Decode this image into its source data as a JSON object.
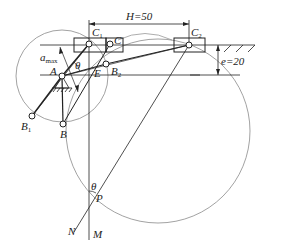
{
  "diagram": {
    "type": "offset slider-crank mechanism (graphical design)",
    "dimensions": {
      "stroke": "H=50",
      "offset": "e=20"
    },
    "labels": {
      "A": "A",
      "B": "B",
      "B1": "B",
      "B1_sub": "1",
      "B2": "B",
      "B2_sub": "2",
      "C": "C",
      "C1": "C",
      "C1_sub": "1",
      "C2": "C",
      "C2_sub": "2",
      "E": "E",
      "P": "P",
      "N": "N",
      "M": "M",
      "theta_top": "θ",
      "theta_bottom": "θ",
      "a_max": "a",
      "a_max_sub": "max"
    },
    "colors": {
      "line": "#222222",
      "circle": "#8a8a8a"
    }
  }
}
